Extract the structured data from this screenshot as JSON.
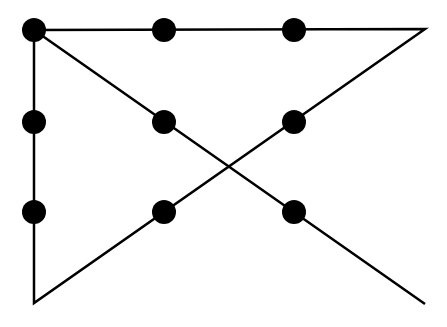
{
  "diagram": {
    "type": "nine-dots-puzzle-solution",
    "colors": {
      "background": "#ffffff",
      "stroke": "#000000",
      "dot": "#000000"
    },
    "stroke_width": 2.5,
    "dot_radius": 12,
    "dots": [
      {
        "x": 34,
        "y": 30
      },
      {
        "x": 164,
        "y": 30
      },
      {
        "x": 294,
        "y": 30
      },
      {
        "x": 34,
        "y": 122
      },
      {
        "x": 164,
        "y": 122
      },
      {
        "x": 294,
        "y": 122
      },
      {
        "x": 34,
        "y": 212
      },
      {
        "x": 164,
        "y": 212
      },
      {
        "x": 294,
        "y": 212
      }
    ],
    "path": [
      {
        "x": 425,
        "y": 304
      },
      {
        "x": 34,
        "y": 30
      },
      {
        "x": 425,
        "y": 29
      },
      {
        "x": 34,
        "y": 303
      },
      {
        "x": 34,
        "y": 30
      }
    ]
  }
}
